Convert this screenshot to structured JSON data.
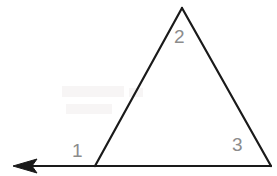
{
  "figure": {
    "type": "geometry-diagram",
    "background_color": "#ffffff",
    "stroke_color": "#1a1a1a",
    "stroke_width": 2,
    "label_color": "#8c8c8c"
  },
  "shapes": {
    "triangle": {
      "name": "triangle",
      "vertices": {
        "left": {
          "x": 95,
          "y": 166
        },
        "apex": {
          "x": 182,
          "y": 8
        },
        "right": {
          "x": 271,
          "y": 166
        }
      }
    },
    "ray": {
      "name": "base-extension-ray",
      "from": {
        "x": 271,
        "y": 166
      },
      "to": {
        "x": 14,
        "y": 166
      },
      "arrowhead_at": "left",
      "arrowhead": {
        "tip_x": 14,
        "back_x": 36,
        "half_height": 7
      }
    }
  },
  "labels": [
    {
      "id": "1",
      "text": "1",
      "x": 78,
      "y": 151,
      "color": "#8c8c8c",
      "describes": "interior-angle-at-left-vertex"
    },
    {
      "id": "2",
      "text": "2",
      "x": 180,
      "y": 37,
      "color": "#8c8c8c",
      "describes": "interior-angle-at-apex"
    },
    {
      "id": "3",
      "text": "3",
      "x": 238,
      "y": 145,
      "color": "#8c8c8c",
      "describes": "interior-angle-at-right-vertex"
    }
  ]
}
